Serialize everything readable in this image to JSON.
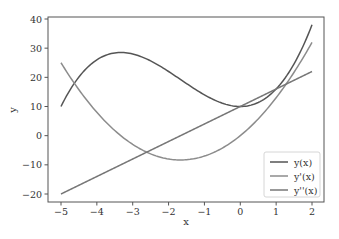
{
  "chart_data": {
    "type": "line",
    "title": "",
    "xlabel": "x",
    "ylabel": "y",
    "xlim": [
      -5.25,
      2.25
    ],
    "ylim": [
      -23,
      41
    ],
    "xticks": [
      -5,
      -4,
      -3,
      -2,
      -1,
      0,
      1,
      2
    ],
    "yticks": [
      -20,
      -10,
      0,
      10,
      20,
      30,
      40
    ],
    "grid": false,
    "legend_position": "lower right",
    "x_range": [
      -5,
      2
    ],
    "series": [
      {
        "name": "y(x)",
        "formula": "x^3 + 5x^2 + 10",
        "color": "#555555",
        "sample_x": [
          -5,
          -4,
          -3.33,
          -3,
          -2,
          -1,
          0,
          1,
          2
        ],
        "sample_y": [
          10,
          26,
          28.5,
          28,
          22,
          14,
          10,
          16,
          38
        ]
      },
      {
        "name": "y'(x)",
        "formula": "3x^2 + 10x",
        "color": "#8c8c8c",
        "sample_x": [
          -5,
          -4,
          -3,
          -2,
          -1.67,
          -1,
          0,
          1,
          2
        ],
        "sample_y": [
          25,
          8,
          -3,
          -8,
          -8.33,
          -7,
          0,
          13,
          32
        ]
      },
      {
        "name": "y''(x)",
        "formula": "6x + 10",
        "color": "#777777",
        "sample_x": [
          -5,
          -4,
          -3,
          -2,
          -1,
          0,
          1,
          2
        ],
        "sample_y": [
          -20,
          -14,
          -8,
          -2,
          4,
          10,
          16,
          22
        ]
      }
    ]
  },
  "labels": {
    "xlabel": "x",
    "ylabel": "y",
    "xticks": [
      "−5",
      "−4",
      "−3",
      "−2",
      "−1",
      "0",
      "1",
      "2"
    ],
    "yticks": [
      "−20",
      "−10",
      "0",
      "10",
      "20",
      "30",
      "40"
    ],
    "legend": [
      "y(x)",
      "y'(x)",
      "y''(x)"
    ]
  }
}
